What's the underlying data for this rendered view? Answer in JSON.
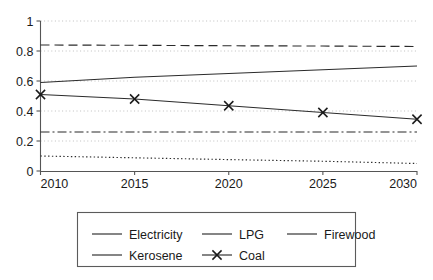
{
  "chart_data": {
    "type": "line",
    "title": "",
    "xlabel": "",
    "ylabel": "",
    "x": [
      2010,
      2015,
      2020,
      2025,
      2030
    ],
    "xtick_labels": [
      "2010",
      "2015",
      "2020",
      "2025",
      "2030"
    ],
    "ytick_labels": [
      "0",
      "0.2",
      "0.4",
      "0.6",
      "0.8",
      "1"
    ],
    "ytick_values": [
      0,
      0.2,
      0.4,
      0.6,
      0.8,
      1
    ],
    "xlim": [
      2010,
      2030
    ],
    "ylim": [
      0,
      1
    ],
    "grid": true,
    "legend_position": "bottom",
    "series": [
      {
        "name": "Electricity",
        "style": "solid",
        "marker": "none",
        "values": [
          0.59,
          0.625,
          0.65,
          0.675,
          0.7
        ]
      },
      {
        "name": "LPG",
        "style": "dashed",
        "marker": "none",
        "values": [
          0.84,
          0.838,
          0.835,
          0.833,
          0.83
        ]
      },
      {
        "name": "Firewood",
        "style": "dotted",
        "marker": "none",
        "values": [
          0.1,
          0.088,
          0.076,
          0.065,
          0.05
        ]
      },
      {
        "name": "Kerosene",
        "style": "dash-dot",
        "marker": "none",
        "values": [
          0.26,
          0.26,
          0.26,
          0.26,
          0.26
        ]
      },
      {
        "name": "Coal",
        "style": "solid",
        "marker": "x",
        "values": [
          0.51,
          0.48,
          0.435,
          0.39,
          0.345
        ]
      }
    ]
  },
  "legend": {
    "entries": [
      {
        "label": "Electricity",
        "style": "solid",
        "marker": "none"
      },
      {
        "label": "LPG",
        "style": "dashed",
        "marker": "none"
      },
      {
        "label": "Firewood",
        "style": "dotted",
        "marker": "none"
      },
      {
        "label": "Kerosene",
        "style": "dash-dot",
        "marker": "none"
      },
      {
        "label": "Coal",
        "style": "solid",
        "marker": "x"
      }
    ]
  },
  "colors": {
    "line": "#2b2b2b",
    "axis": "#555555",
    "grid": "#b8b8b8",
    "background": "#ffffff",
    "legend_border": "#5b5b5b"
  }
}
